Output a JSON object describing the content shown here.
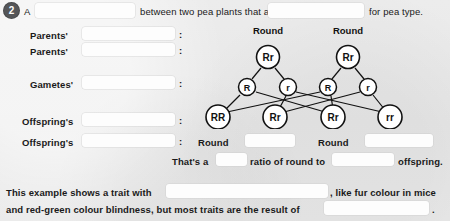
{
  "question": {
    "number": "2",
    "intro_part1": "A",
    "intro_part2": "between two pea plants that are",
    "intro_part3": "for pea type."
  },
  "rows": [
    {
      "label": "Parents'",
      "colon": ":"
    },
    {
      "label": "Parents'",
      "colon": ":"
    },
    {
      "label": "Gametes'",
      "colon": ":"
    },
    {
      "label": "Offspring's",
      "colon": ":"
    },
    {
      "label": "Offspring's",
      "colon": ":"
    }
  ],
  "diagram": {
    "parents_phenotypes": [
      "Round",
      "Round"
    ],
    "parents_genotypes": [
      "Rr",
      "Rr"
    ],
    "gametes": [
      "R",
      "r",
      "R",
      "r"
    ],
    "offspring_genotypes": [
      "RR",
      "Rr",
      "Rr",
      "rr"
    ],
    "offspring_phenotypes": [
      "Round",
      "Round"
    ]
  },
  "ratio_line": {
    "part1": "That's a",
    "part2": "ratio of round to",
    "part3": "offspring."
  },
  "conclusion": {
    "part1": "This example shows a trait with",
    "part2": ", like fur colour in mice",
    "part3": "and red-green colour blindness, but most traits are the result of",
    "part4": "."
  },
  "colors": {
    "page_background": "#e9e9e9",
    "blank_fill": "#fdfdfd",
    "text": "#1a1a1a",
    "badge_background": "#555658",
    "badge_text": "#ffffff",
    "diagram_stroke": "#111111",
    "circle_fill": "#ffffff"
  }
}
